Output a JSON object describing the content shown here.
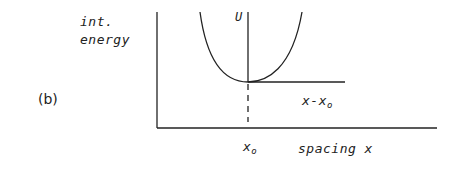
{
  "panel_label": "(b)",
  "y_axis": {
    "label_line1": "int.",
    "label_line2": "energy"
  },
  "x_axis": {
    "label": "spacing x"
  },
  "annotations": {
    "curve_label": "U",
    "displacement_label_base": "x-x",
    "displacement_label_sub": "o",
    "equilibrium_label_base": "x",
    "equilibrium_label_sub": "o"
  },
  "colors": {
    "stroke": "#222222",
    "background": "#ffffff"
  }
}
